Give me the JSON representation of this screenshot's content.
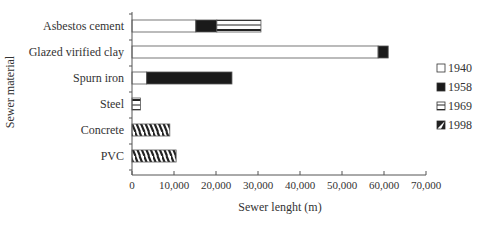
{
  "chart_data": {
    "type": "bar",
    "orientation": "horizontal",
    "stacked": true,
    "title": "",
    "xlabel": "Sewer lenght (m)",
    "ylabel": "Sewer material",
    "xlim": [
      0,
      70000
    ],
    "x_ticks": [
      "0",
      "10,000",
      "20,000",
      "30,000",
      "40,000",
      "50,000",
      "60,000",
      "70,000"
    ],
    "x_tick_values": [
      0,
      10000,
      20000,
      30000,
      40000,
      50000,
      60000,
      70000
    ],
    "grid": false,
    "legend_position": "right",
    "categories": [
      "Asbestos cement",
      "Glazed virified clay",
      "Spurn iron",
      "Steel",
      "Concrete",
      "PVC"
    ],
    "series": [
      {
        "name": "1940",
        "pattern": "white",
        "values": [
          15200,
          58600,
          3500,
          0,
          0,
          0
        ]
      },
      {
        "name": "1958",
        "pattern": "black",
        "values": [
          5000,
          2400,
          20300,
          0,
          0,
          0
        ]
      },
      {
        "name": "1969",
        "pattern": "horizontal-lines",
        "values": [
          10500,
          0,
          0,
          2000,
          0,
          0
        ]
      },
      {
        "name": "1998",
        "pattern": "diagonal-hatch",
        "values": [
          0,
          0,
          0,
          0,
          9000,
          10500
        ]
      }
    ]
  }
}
